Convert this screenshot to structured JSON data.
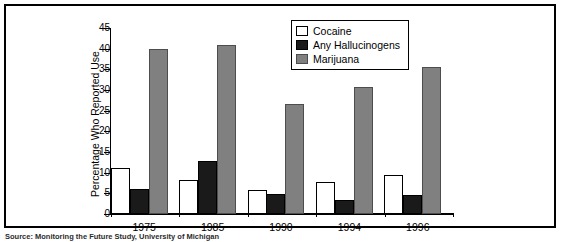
{
  "chart_data": {
    "type": "bar",
    "title": "",
    "xlabel": "",
    "ylabel": "Percentage Who Reported Use",
    "categories": [
      "1975",
      "1985",
      "1990",
      "1994",
      "1996"
    ],
    "series": [
      {
        "name": "Cocaine",
        "color": "#ffffff",
        "values": [
          11.2,
          8.3,
          5.9,
          7.8,
          9.5
        ]
      },
      {
        "name": "Any Hallucinogens",
        "color": "#1a1a1a",
        "values": [
          6.0,
          12.9,
          4.8,
          3.5,
          4.5
        ]
      },
      {
        "name": "Marijuana",
        "color": "#808080",
        "values": [
          40.0,
          41.0,
          26.7,
          30.8,
          35.6
        ]
      }
    ],
    "ylim": [
      0,
      45
    ],
    "yticks": [
      "0",
      "5",
      "10",
      "15",
      "20",
      "25",
      "30",
      "35",
      "40",
      "45"
    ],
    "grid": false,
    "legend_position": "top-right"
  },
  "caption": {
    "text": "Source: Monitoring the Future Study, University of Michigan"
  }
}
